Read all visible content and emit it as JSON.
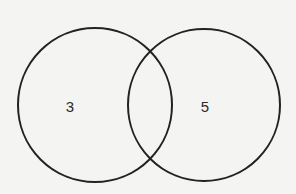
{
  "diagram": {
    "type": "venn",
    "background_color": "#f4f4f3",
    "stroke_color": "#222222",
    "sets": [
      {
        "id": "left",
        "region_value": "3",
        "circle": {
          "cx": 95,
          "cy": 105,
          "r": 77
        },
        "label_position": {
          "x": 70,
          "y": 106
        }
      },
      {
        "id": "right",
        "region_value": "5",
        "circle": {
          "cx": 204,
          "cy": 105,
          "r": 76
        },
        "label_position": {
          "x": 205,
          "y": 106
        }
      }
    ],
    "intersection_value": ""
  }
}
